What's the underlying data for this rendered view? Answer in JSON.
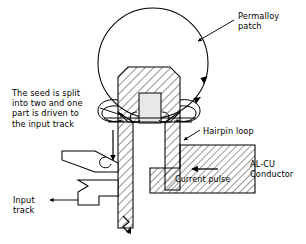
{
  "figure": {
    "width": 306,
    "height": 244,
    "stroke_color": "#000000",
    "background_color": "#ffffff",
    "hatch_color": "#000000",
    "slot_fill_color": "#e8e8e8"
  },
  "labels": {
    "permalloy_patch": "Permalloy\npatch",
    "hairpin_loop": "Hairpin loop",
    "alcu_conductor": "AL-CU\nConductor",
    "current_pulse": "Current pulse",
    "seed_note": "The seed is split\ninto two and one\npart is driven to\nthe input track",
    "input_track": "Input\ntrack"
  },
  "parts": {
    "permalloy_patch": {
      "shape": "circle",
      "cx": 153,
      "cy": 63,
      "r": 55,
      "rotation_arrows": 2
    },
    "hairpin_loop": {
      "shape": "hatched-hexagon-head-with-two-legs",
      "head_top_y": 67,
      "leg_bottom_y": 228
    },
    "alcu_conductor": {
      "shape": "L-shaped-hatched-block",
      "x": 150,
      "y": 145,
      "width": 105,
      "height": 48
    },
    "current_pulse": {
      "direction": "left",
      "arrow_y": 169
    },
    "input_track": {
      "elements": 2,
      "direction": "right"
    },
    "seed_arrow": {
      "direction": "down",
      "x": 113,
      "from_y": 130,
      "to_y": 160
    },
    "break_symbol": {
      "x": 127,
      "y": 222
    }
  }
}
